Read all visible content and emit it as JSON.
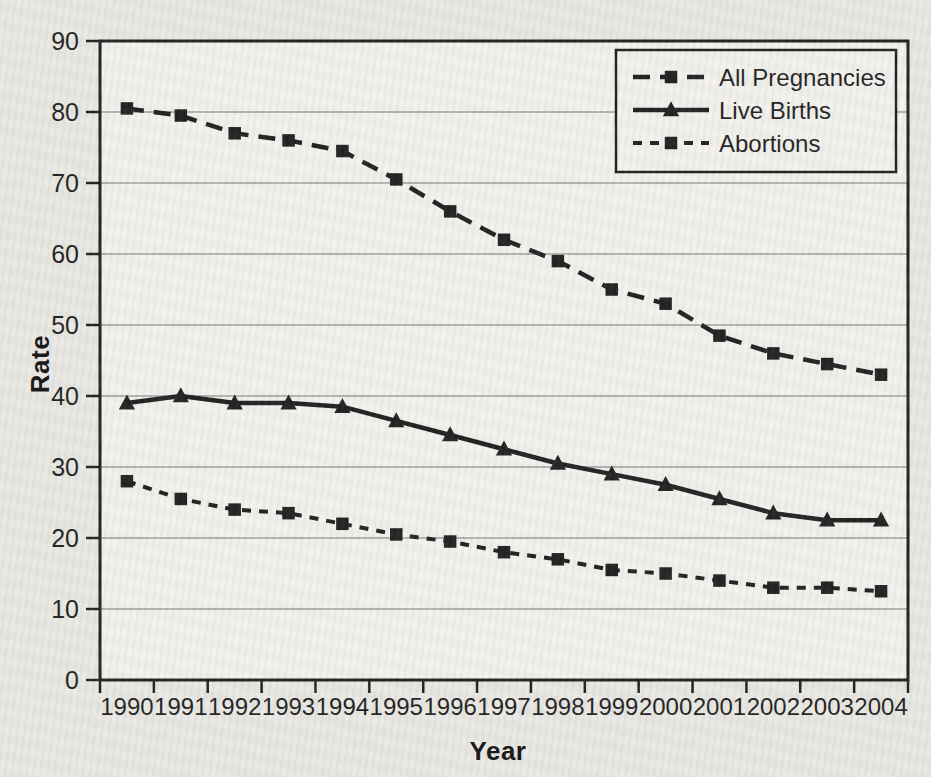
{
  "figure": {
    "page_background": "#e9e7e3",
    "plot_background": "#f2f1ed",
    "ink_color": "#1b1b1b",
    "gridline_color": "#9b9b9b"
  },
  "chart_data": {
    "type": "line",
    "title": "",
    "xlabel": "Year",
    "ylabel": "Rate",
    "x": [
      1990,
      1991,
      1992,
      1993,
      1994,
      1995,
      1996,
      1997,
      1998,
      1999,
      2000,
      2001,
      2002,
      2003,
      2004
    ],
    "ylim": [
      0,
      90
    ],
    "yticks": [
      0,
      10,
      20,
      30,
      40,
      50,
      60,
      70,
      80,
      90
    ],
    "grid": "horizontal",
    "legend_position": "top-right",
    "series": [
      {
        "name": "All Pregnancies",
        "line_style": "dashed-long",
        "marker": "square",
        "values": [
          80.5,
          79.5,
          77,
          76,
          74.5,
          70.5,
          66,
          62,
          59,
          55,
          53,
          48.5,
          46,
          44.5,
          43
        ]
      },
      {
        "name": "Live Births",
        "line_style": "solid",
        "marker": "triangle",
        "values": [
          39,
          40,
          39,
          39,
          38.5,
          36.5,
          34.5,
          32.5,
          30.5,
          29,
          27.5,
          25.5,
          23.5,
          22.5,
          22.5
        ]
      },
      {
        "name": "Abortions",
        "line_style": "dashed-short",
        "marker": "square",
        "values": [
          28,
          25.5,
          24,
          23.5,
          22,
          20.5,
          19.5,
          18,
          17,
          15.5,
          15,
          14,
          13,
          13,
          12.5
        ]
      }
    ]
  }
}
